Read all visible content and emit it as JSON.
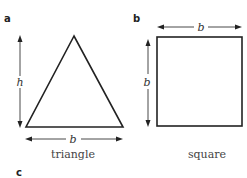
{
  "panels": [
    {
      "label": "a",
      "shape": "triangle",
      "caption": "triangle",
      "dims": {
        "height": "h",
        "base": "b"
      }
    },
    {
      "label": "b",
      "shape": "square",
      "caption": "square",
      "dims": {
        "height": "b",
        "base": "b"
      }
    },
    {
      "label": "c"
    }
  ],
  "colors": {
    "stroke": "#222222",
    "text": "#444444",
    "background": "#ffffff"
  }
}
